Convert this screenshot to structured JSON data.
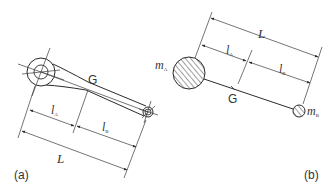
{
  "figure": {
    "panel_a": {
      "caption": "(a)",
      "center_of_gravity": "G",
      "dimensions": {
        "lA": {
          "main": "l",
          "sub": "A"
        },
        "lB": {
          "main": "l",
          "sub": "B"
        },
        "L": "L"
      },
      "description": "Connecting rod with big end and small end"
    },
    "panel_b": {
      "caption": "(b)",
      "center_of_gravity": "G",
      "masses": {
        "mA": {
          "main": "m",
          "sub": "A"
        },
        "mB": {
          "main": "m",
          "sub": "B"
        }
      },
      "dimensions": {
        "lA": {
          "main": "l",
          "sub": "A"
        },
        "lB": {
          "main": "l",
          "sub": "B"
        },
        "L": "L"
      },
      "description": "Equivalent two-mass model"
    },
    "colors": {
      "line": "#2a2a2a",
      "background": "#ffffff"
    }
  }
}
